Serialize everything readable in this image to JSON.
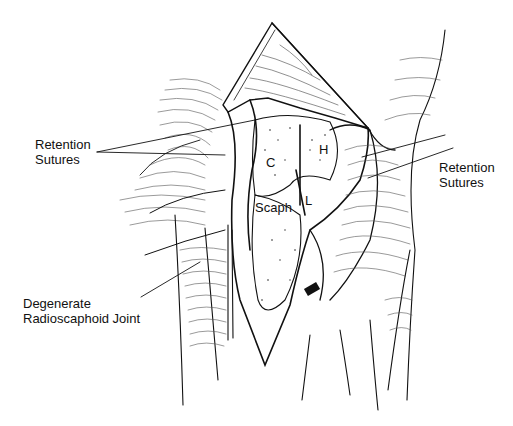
{
  "figure": {
    "labels": {
      "retention_sutures_left": [
        "Retention",
        "Sutures"
      ],
      "retention_sutures_right": [
        "Retention",
        "Sutures"
      ],
      "degenerate_joint": [
        "Degenerate",
        "Radioscaphoid Joint"
      ],
      "bone_c": "C",
      "bone_h": "H",
      "bone_l": "L",
      "bone_scaph": "Scaph"
    },
    "colors": {
      "ink": "#111111",
      "background": "#ffffff"
    }
  }
}
